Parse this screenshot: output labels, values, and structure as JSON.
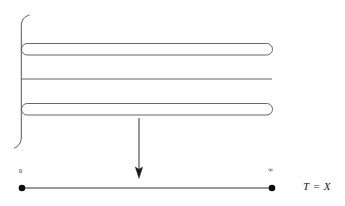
{
  "figure": {
    "title": "",
    "stroke_color": "#4d4d4d",
    "axis_color": "#333333",
    "arrow_color": "#333333",
    "background": "#ffffff"
  },
  "labels": {
    "zero": "0",
    "infinity": "∞",
    "equation": "T = X"
  },
  "shapes": {
    "brace": {
      "name": "left-brace",
      "x": 21,
      "y_top": 15,
      "y_bottom": 148
    },
    "tube_top": {
      "name": "rounded-tube-top",
      "x1": 21,
      "x2": 272,
      "y1": 43,
      "y2": 55
    },
    "tube_bottom": {
      "name": "rounded-tube-bottom",
      "x1": 21,
      "x2": 272,
      "y1": 103,
      "y2": 115
    },
    "middle_line": {
      "name": "middle-horizontal-line",
      "x1": 21,
      "x2": 272,
      "y": 79
    },
    "arrow": {
      "name": "down-arrow",
      "x": 139,
      "y_start": 118,
      "y_end": 178
    },
    "interval": {
      "name": "bottom-interval",
      "x1": 22,
      "x2": 272,
      "y": 188,
      "endpoint_radius": 3.2
    }
  }
}
